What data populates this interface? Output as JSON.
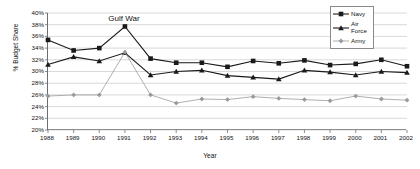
{
  "chart_data": {
    "type": "line",
    "title": "",
    "xlabel": "Year",
    "ylabel": "% Budget Share",
    "grid": true,
    "legend_position": "top-right",
    "categories": [
      1988,
      1989,
      1990,
      1991,
      1992,
      1993,
      1994,
      1995,
      1996,
      1997,
      1998,
      1999,
      2000,
      2001,
      2002
    ],
    "x": [
      "1988",
      "1989",
      "1990",
      "1991",
      "1992",
      "1993",
      "1994",
      "1995",
      "1996",
      "1997",
      "1998",
      "1999",
      "2000",
      "2001",
      "2002"
    ],
    "xlim": [
      1988,
      2002
    ],
    "ylim": [
      20,
      40
    ],
    "ytick_step": 2,
    "ytick_labels": [
      "40%",
      "38%",
      "36%",
      "34%",
      "32%",
      "30%",
      "28%",
      "26%",
      "24%",
      "22%",
      "20%"
    ],
    "ytick_values": [
      40,
      38,
      36,
      34,
      32,
      30,
      28,
      26,
      24,
      22,
      20
    ],
    "series": [
      {
        "name": "Navy",
        "marker": "square",
        "color": "#1a1a1a",
        "values": [
          35.4,
          33.6,
          34.0,
          37.7,
          32.2,
          31.5,
          31.5,
          30.8,
          31.8,
          31.4,
          31.9,
          31.1,
          31.3,
          32.0,
          30.9
        ]
      },
      {
        "name": "Air Force",
        "marker": "triangle",
        "color": "#1a1a1a",
        "values": [
          31.2,
          32.5,
          31.8,
          33.2,
          29.4,
          30.0,
          30.2,
          29.3,
          29.0,
          28.7,
          30.2,
          29.9,
          29.4,
          30.0,
          29.8
        ]
      },
      {
        "name": "Army",
        "marker": "diamond",
        "color": "#9a9a9a",
        "values": [
          25.8,
          26.0,
          26.0,
          33.3,
          26.0,
          24.6,
          25.3,
          25.2,
          25.7,
          25.4,
          25.2,
          25.0,
          25.8,
          25.3,
          25.1
        ]
      }
    ],
    "annotations": [
      {
        "text": "Gulf War",
        "x": 1991,
        "y": 39.1
      }
    ]
  },
  "legend": {
    "items": [
      {
        "label": "Navy"
      },
      {
        "label": "Air\nForce"
      },
      {
        "label": "Army"
      }
    ]
  }
}
